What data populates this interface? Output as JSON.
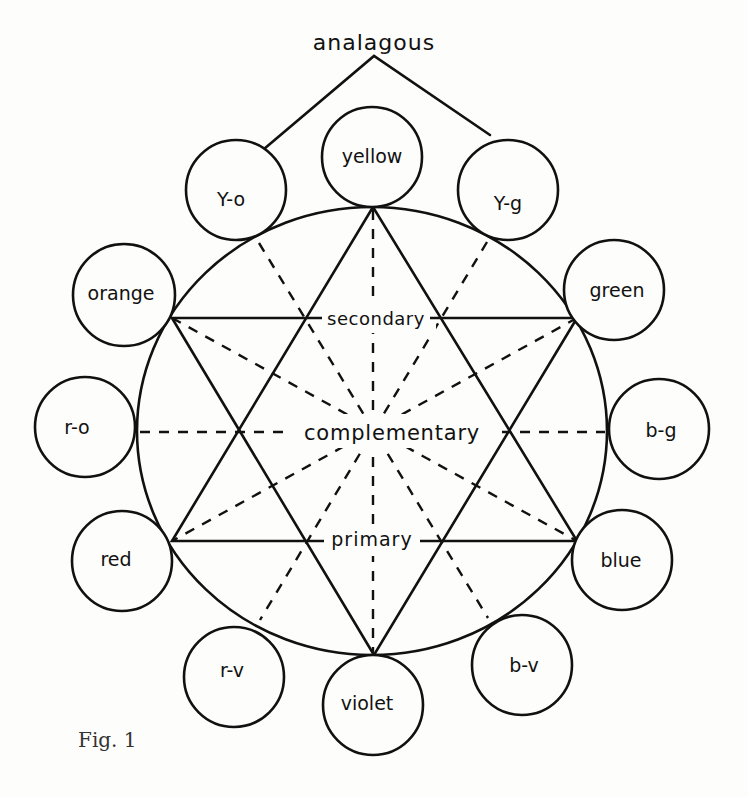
{
  "figure": {
    "caption": "Fig. 1",
    "title_label": "analagous",
    "center_labels": {
      "secondary": "secondary",
      "complementary": "complementary",
      "primary": "primary"
    },
    "colors": {
      "ink": "#111111",
      "paper": "#fdfdfb"
    }
  },
  "wheel": {
    "center": [
      372,
      431
    ],
    "rx": 235,
    "ry": 224,
    "nodes": [
      {
        "id": "yellow",
        "label": "yellow",
        "cx": 372,
        "cy": 157,
        "r": 50
      },
      {
        "id": "y-g",
        "label": "Y-g",
        "cx": 508,
        "cy": 190,
        "r": 50
      },
      {
        "id": "green",
        "label": "green",
        "cx": 614,
        "cy": 290,
        "r": 50
      },
      {
        "id": "b-g",
        "label": "b-g",
        "cx": 659,
        "cy": 429,
        "r": 50
      },
      {
        "id": "blue",
        "label": "blue",
        "cx": 622,
        "cy": 560,
        "r": 50
      },
      {
        "id": "b-v",
        "label": "b-v",
        "cx": 522,
        "cy": 665,
        "r": 50
      },
      {
        "id": "violet",
        "label": "violet",
        "cx": 373,
        "cy": 705,
        "r": 50
      },
      {
        "id": "r-v",
        "label": "r-v",
        "cx": 234,
        "cy": 677,
        "r": 50
      },
      {
        "id": "red",
        "label": "red",
        "cx": 122,
        "cy": 561,
        "r": 50
      },
      {
        "id": "r-o",
        "label": "r-o",
        "cx": 85,
        "cy": 427,
        "r": 50
      },
      {
        "id": "orange",
        "label": "orange",
        "cx": 124,
        "cy": 295,
        "r": 51
      },
      {
        "id": "y-o",
        "label": "Y-o",
        "cx": 236,
        "cy": 190,
        "r": 50
      }
    ],
    "primary_triangle": [
      "yellow",
      "red",
      "blue"
    ],
    "secondary_triangle": [
      "orange",
      "green",
      "violet"
    ],
    "complementary_pairs": [
      [
        "yellow",
        "violet"
      ],
      [
        "y-o",
        "b-v"
      ],
      [
        "y-g",
        "r-v"
      ],
      [
        "orange",
        "blue"
      ],
      [
        "green",
        "red"
      ],
      [
        "r-o",
        "b-g"
      ]
    ],
    "analogous_group": [
      "y-o",
      "yellow",
      "y-g"
    ]
  }
}
